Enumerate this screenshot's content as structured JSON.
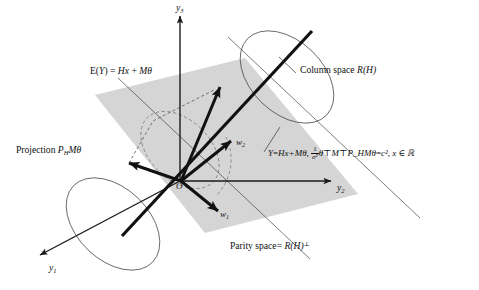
{
  "figure": {
    "background": "#ffffff",
    "line_color": "#1a1a1a",
    "plane_fill": "#d4d4d4",
    "dashed_color": "#555555"
  },
  "axes": [
    {
      "name": "y3",
      "label_main": "y",
      "label_sub": "3",
      "x": 176,
      "y": 6
    },
    {
      "name": "y2",
      "label_main": "y",
      "label_sub": "2",
      "x": 338,
      "y": 182
    },
    {
      "name": "y1",
      "label_main": "y",
      "label_sub": "1",
      "x": 50,
      "y": 265
    }
  ],
  "vectors": [
    {
      "name": "w1",
      "label_main": "w",
      "label_sub": "1",
      "x": 220,
      "y": 209
    },
    {
      "name": "w2",
      "label_main": "w",
      "label_sub": "2",
      "x": 238,
      "y": 138
    }
  ],
  "origin": {
    "label": "O",
    "x": 178,
    "y": 180
  },
  "annotations": {
    "expectation": {
      "name": "expectation-label",
      "parts": [
        "E(",
        "Y",
        ") = ",
        "Hx",
        " + ",
        "M",
        "θ"
      ],
      "plain": "E(Y) = Hx + Mθ",
      "x": 90,
      "y": 68
    },
    "column_space": {
      "name": "column-space-label",
      "prefix": "Column space ",
      "symbol": "R",
      "arg": "(H)",
      "plain": "Column space R(H)",
      "x": 300,
      "y": 68
    },
    "projection": {
      "name": "projection-label",
      "prefix": "Projection ",
      "symbol_p": "P",
      "symbol_p_sub": "H",
      "symbol_m": "M",
      "symbol_theta": "θ",
      "plain": "Projection P_H Mθ",
      "x": 16,
      "y": 146
    },
    "parity_space": {
      "name": "parity-space-label",
      "prefix": "Parity space",
      "eq": "= ",
      "symbol": "R",
      "arg": "(H)",
      "perp": "⊥",
      "plain": "Parity space= R(H)⊥",
      "x": 230,
      "y": 243
    },
    "model_equation": {
      "name": "model-equation-label",
      "lhs": "Y",
      "eq1": "=",
      "mean": "Hx+Mθ",
      "comma": ", ",
      "frac_num": "1",
      "frac_den": "σ²",
      "quad": "θ⊤M⊤P_HMθ",
      "eq2": "=",
      "rhs": "c²",
      "domain": ", x ∈ ℝ",
      "plain": "Y=Hx+Mθ,  (1/σ²) θ⊤M⊤P_HMθ = c², x∈ℝ",
      "x": 268,
      "y": 148
    }
  }
}
